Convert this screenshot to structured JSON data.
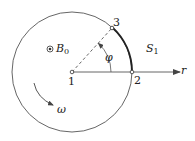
{
  "diagram": {
    "points": [
      {
        "id": "1",
        "label": "1"
      },
      {
        "id": "2",
        "label": "2"
      },
      {
        "id": "3",
        "label": "3"
      }
    ],
    "labels": {
      "field": "B",
      "field_sub": "0",
      "surface": "S",
      "surface_sub": "1",
      "angle": "φ",
      "omega": "ω",
      "axis": "r"
    },
    "colors": {
      "stroke": "#555555",
      "arc_highlight": "#222222",
      "text": "#222222"
    }
  }
}
